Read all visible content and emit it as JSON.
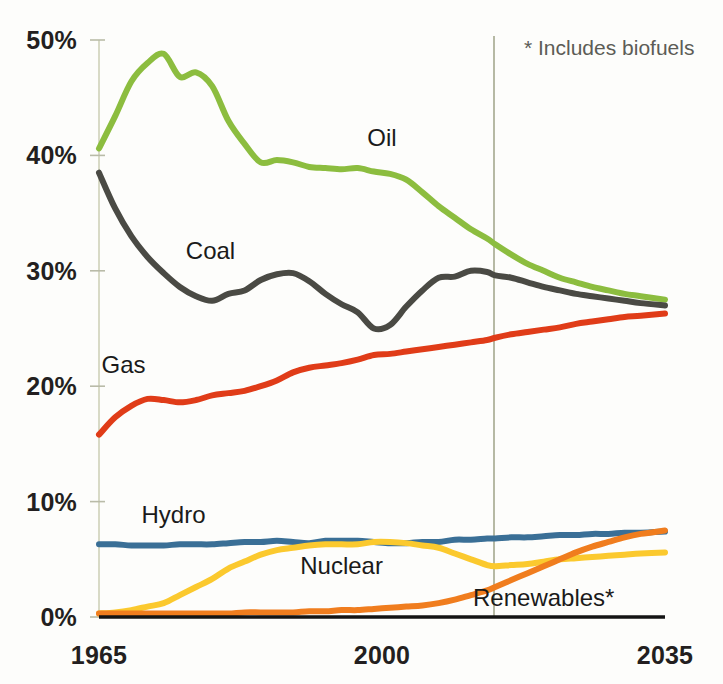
{
  "chart_data": {
    "type": "line",
    "title": "",
    "subtitle": "",
    "xlabel": "",
    "ylabel": "",
    "xlim": [
      1965,
      2035
    ],
    "ylim": [
      0,
      50
    ],
    "grid": false,
    "legend_position": "inline-labels",
    "x_ticks": [
      "1965",
      "2000",
      "2035"
    ],
    "x_tick_values": [
      1965,
      2000,
      2035
    ],
    "y_ticks": [
      "0%",
      "10%",
      "20%",
      "30%",
      "40%",
      "50%"
    ],
    "y_tick_values": [
      0,
      10,
      20,
      30,
      40,
      50
    ],
    "annotations": [
      {
        "name": "footnote",
        "text": "* Includes biofuels"
      },
      {
        "name": "forecast-divider",
        "x_value": 2014,
        "description": "vertical line separating history from projection"
      }
    ],
    "x": [
      1965,
      1967,
      1969,
      1971,
      1973,
      1975,
      1977,
      1979,
      1981,
      1983,
      1985,
      1987,
      1989,
      1991,
      1993,
      1995,
      1997,
      1999,
      2001,
      2003,
      2005,
      2007,
      2009,
      2011,
      2013,
      2014,
      2016,
      2018,
      2020,
      2022,
      2024,
      2026,
      2028,
      2030,
      2032,
      2035
    ],
    "series": [
      {
        "name": "Oil",
        "label": "Oil",
        "color": "#8cbd3f",
        "label_x": 2000,
        "values": [
          40.6,
          43.4,
          46.4,
          48.0,
          48.8,
          46.8,
          47.2,
          46.0,
          43.0,
          41.0,
          39.4,
          39.6,
          39.4,
          39.0,
          38.9,
          38.8,
          38.9,
          38.6,
          38.4,
          37.9,
          36.8,
          35.6,
          34.6,
          33.6,
          32.8,
          32.3,
          31.4,
          30.6,
          30.0,
          29.4,
          29.0,
          28.6,
          28.3,
          28.0,
          27.8,
          27.5
        ]
      },
      {
        "name": "Coal",
        "label": "Coal",
        "color": "#4a4a44",
        "label_x": 1975,
        "values": [
          38.5,
          35.4,
          33.0,
          31.2,
          29.8,
          28.6,
          27.8,
          27.4,
          28.0,
          28.3,
          29.2,
          29.7,
          29.8,
          29.1,
          28.0,
          27.1,
          26.4,
          25.0,
          25.3,
          26.9,
          28.3,
          29.4,
          29.5,
          30.0,
          29.9,
          29.6,
          29.4,
          29.0,
          28.6,
          28.3,
          28.0,
          27.8,
          27.6,
          27.4,
          27.2,
          27.0
        ]
      },
      {
        "name": "Gas",
        "label": "Gas",
        "color": "#e03c18",
        "label_x": 1972,
        "values": [
          15.8,
          17.3,
          18.3,
          18.9,
          18.8,
          18.6,
          18.8,
          19.2,
          19.4,
          19.6,
          20.0,
          20.5,
          21.2,
          21.6,
          21.8,
          22.0,
          22.3,
          22.7,
          22.8,
          23.0,
          23.2,
          23.4,
          23.6,
          23.8,
          24.0,
          24.2,
          24.5,
          24.7,
          24.9,
          25.1,
          25.4,
          25.6,
          25.8,
          26.0,
          26.1,
          26.3
        ]
      },
      {
        "name": "Hydro",
        "label": "Hydro",
        "color": "#3a6f96",
        "label_x": 1971,
        "values": [
          6.3,
          6.3,
          6.2,
          6.2,
          6.2,
          6.3,
          6.3,
          6.3,
          6.4,
          6.5,
          6.5,
          6.6,
          6.5,
          6.4,
          6.6,
          6.6,
          6.6,
          6.5,
          6.4,
          6.4,
          6.5,
          6.5,
          6.7,
          6.7,
          6.8,
          6.8,
          6.9,
          6.9,
          7.0,
          7.1,
          7.1,
          7.2,
          7.2,
          7.3,
          7.3,
          7.4
        ]
      },
      {
        "name": "Nuclear",
        "label": "Nuclear",
        "color": "#fbc92e",
        "label_x": 1995,
        "values": [
          0.3,
          0.4,
          0.6,
          0.9,
          1.2,
          1.9,
          2.6,
          3.3,
          4.2,
          4.8,
          5.4,
          5.8,
          6.0,
          6.2,
          6.3,
          6.3,
          6.3,
          6.5,
          6.5,
          6.4,
          6.2,
          6.0,
          5.5,
          5.0,
          4.5,
          4.4,
          4.5,
          4.6,
          4.8,
          5.0,
          5.1,
          5.2,
          5.3,
          5.4,
          5.5,
          5.6
        ]
      },
      {
        "name": "Renewables",
        "label": "Renewables*",
        "color": "#f07d1e",
        "label_x": 2020,
        "values": [
          0.3,
          0.3,
          0.3,
          0.3,
          0.3,
          0.3,
          0.3,
          0.3,
          0.3,
          0.4,
          0.4,
          0.4,
          0.4,
          0.5,
          0.5,
          0.6,
          0.6,
          0.7,
          0.8,
          0.9,
          1.0,
          1.2,
          1.5,
          1.9,
          2.3,
          2.6,
          3.2,
          3.8,
          4.4,
          5.0,
          5.6,
          6.1,
          6.5,
          6.9,
          7.2,
          7.5
        ]
      }
    ]
  }
}
